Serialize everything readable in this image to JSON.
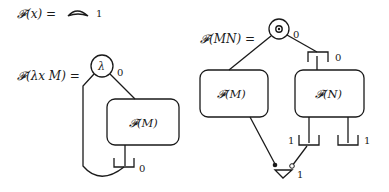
{
  "rules": [
    {
      "id": "variable",
      "lhs": "𝓕(x) =",
      "node": {
        "shape": "half-moon-arc"
      },
      "port_label": "1"
    },
    {
      "id": "abstraction",
      "lhs": "𝓕(λx M) =",
      "root_node": {
        "symbol": "λ",
        "port_label": "0"
      },
      "box": {
        "label": "𝓕(M)"
      },
      "weakening": {
        "port_label": "0"
      }
    },
    {
      "id": "application",
      "lhs": "𝓕(MN) =",
      "root_node": {
        "symbol": "@",
        "port_label": "0"
      },
      "bracket_top": {
        "port_label": "0"
      },
      "box_left": {
        "label": "𝓕(M)"
      },
      "box_right": {
        "label": "𝓕(N)"
      },
      "bracket_mid": {
        "port_label": "1"
      },
      "bracket_right": {
        "port_label": "1"
      },
      "croissant": {
        "port_label": "1"
      }
    }
  ]
}
